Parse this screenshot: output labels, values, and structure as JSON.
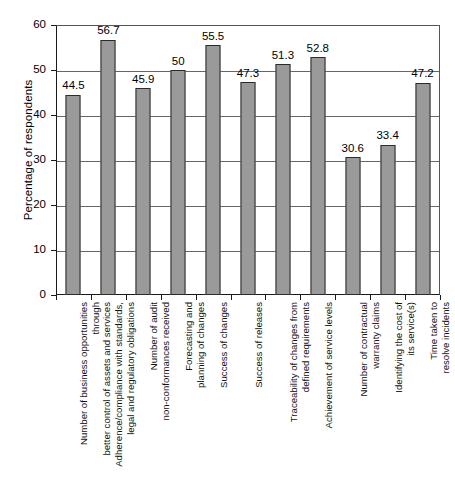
{
  "chart_data": {
    "type": "bar",
    "title": "",
    "subtitle": "",
    "xlabel": "",
    "ylabel": "Percentage of respondents",
    "ylim": [
      0,
      60
    ],
    "ytick_step": 10,
    "yticks": [
      "0",
      "10",
      "20",
      "30",
      "40",
      "50",
      "60"
    ],
    "grid": "horizontal",
    "legend": "none",
    "bar_color": "#9a9a9a",
    "bar_border_color": "#2b2b2b",
    "categories": [
      "Number of business opportunities through better control of assets and services",
      "Adherence/compliance with standards, legal and regulatory obligations",
      "Number of audit non-conformances received",
      "Forecasting and planning of changes",
      "Success of changes",
      "Success of releases",
      "Traceability of changes from defined requirements",
      "Achievement of service levels",
      "Number of contractual warranty claims",
      "Identifying the cost of its service(s)",
      "Time taken to resolve incidents"
    ],
    "category_lines": [
      [
        "Number of business opportunities through",
        "better control of assets and services"
      ],
      [
        "Adherence/compliance with standards,",
        "legal and regulatory obligations"
      ],
      [
        "Number of audit",
        "non-conformances received"
      ],
      [
        "Forecasting and",
        "planning of changes"
      ],
      [
        "Success of changes"
      ],
      [
        "Success of releases"
      ],
      [
        "Traceability of changes from",
        "defined requirements"
      ],
      [
        "Achievement of service levels"
      ],
      [
        "Number of contractual",
        "warranty claims"
      ],
      [
        "Identifying the cost of",
        "its service(s)"
      ],
      [
        "Time taken to",
        "resolve incidents"
      ]
    ],
    "values": [
      44.5,
      56.7,
      45.9,
      50,
      55.5,
      47.3,
      51.3,
      52.8,
      30.6,
      33.4,
      47.2
    ],
    "value_labels": [
      "44.5",
      "56.7",
      "45.9",
      "50",
      "55.5",
      "47.3",
      "51.3",
      "52.8",
      "30.6",
      "33.4",
      "47.2"
    ]
  }
}
